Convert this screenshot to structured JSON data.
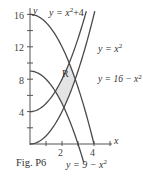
{
  "figure": {
    "caption": "Fig. P6",
    "region_label": "R",
    "axis_labels": {
      "x": "x",
      "y": "y"
    },
    "y_ticks": [
      "16",
      "12",
      "8",
      "4"
    ],
    "x_ticks": [
      "2",
      "4"
    ],
    "curve_labels": {
      "c1_lhs": "y = x",
      "c1_exp": "2",
      "c1_rhs": "+4",
      "c2_lhs": "y = x",
      "c2_exp": "2",
      "c3_lhs": "y = 16 − x",
      "c3_exp": "2",
      "c4_lhs": "y = 9 − x",
      "c4_exp": "2"
    },
    "colors": {
      "curve": "#4a4a4a",
      "axis": "#555555",
      "region_fill": "#e4e4e4",
      "text": "#333333"
    }
  },
  "chart_data": {
    "type": "line",
    "title": "Fig. P6",
    "xlabel": "x",
    "ylabel": "y",
    "xlim": [
      0,
      4.5
    ],
    "ylim": [
      0,
      16
    ],
    "x_ticks": [
      1,
      2,
      3,
      4
    ],
    "y_ticks": [
      2,
      4,
      6,
      8,
      10,
      12,
      14,
      16
    ],
    "x_tick_labels": [
      "2",
      "4"
    ],
    "y_tick_labels": [
      "4",
      "8",
      "12",
      "16"
    ],
    "grid": false,
    "series": [
      {
        "name": "y = x^2 + 4",
        "formula": "x^2+4",
        "x": [
          0,
          1,
          2,
          3,
          3.46
        ],
        "values": [
          4,
          5,
          8,
          13,
          16
        ]
      },
      {
        "name": "y = x^2",
        "formula": "x^2",
        "x": [
          0,
          1,
          2,
          3,
          4
        ],
        "values": [
          0,
          1,
          4,
          9,
          16
        ]
      },
      {
        "name": "y = 16 - x^2",
        "formula": "16-x^2",
        "x": [
          0,
          1,
          2,
          3,
          4
        ],
        "values": [
          16,
          15,
          12,
          7,
          0
        ]
      },
      {
        "name": "y = 9 - x^2",
        "formula": "9-x^2",
        "x": [
          0,
          1,
          2,
          3,
          3.3
        ],
        "values": [
          9,
          8,
          5,
          0,
          -1.9
        ]
      }
    ],
    "annotations": [
      {
        "text": "R",
        "description": "shaded region bounded by y=x^2, y=x^2+4, y=9-x^2, y=16-x^2"
      }
    ]
  }
}
